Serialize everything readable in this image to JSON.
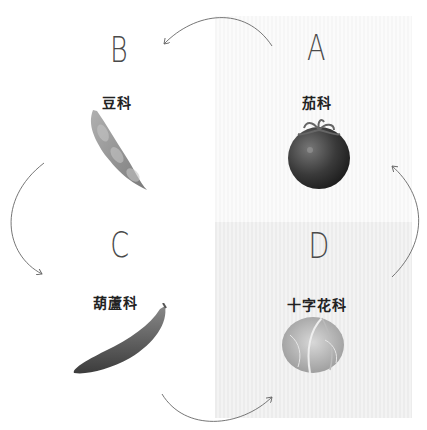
{
  "quadrants": [
    {
      "id": "A",
      "letter": "A",
      "family": "茄科",
      "vegetable": "tomato",
      "background": "#f8f8f8"
    },
    {
      "id": "B",
      "letter": "B",
      "family": "豆科",
      "vegetable": "bean-pod",
      "background": "#ffffff"
    },
    {
      "id": "C",
      "letter": "C",
      "family": "葫蘆科",
      "vegetable": "cucumber",
      "background": "#ffffff"
    },
    {
      "id": "D",
      "letter": "D",
      "family": "十字花科",
      "vegetable": "cabbage",
      "background": "#efefef"
    }
  ],
  "rotation_order": [
    "A",
    "B",
    "C",
    "D"
  ],
  "arrow_color": "#666666"
}
